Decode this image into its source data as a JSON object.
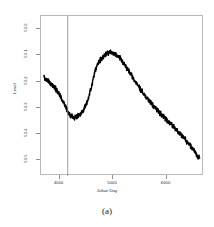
{
  "figure": {
    "caption": "(a)"
  },
  "chart_data": {
    "type": "line",
    "title": "",
    "xlabel": "Julian Day",
    "ylabel": "Level",
    "xlim": [
      3650,
      6700
    ],
    "ylim": [
      52.95,
      53.56
    ],
    "y_inverted": true,
    "grid": false,
    "legend": null,
    "xticks": [
      4000,
      5000,
      6000
    ],
    "xtick_labels": [
      "4000",
      "5000",
      "6000"
    ],
    "yticks": [
      53.0,
      53.1,
      53.2,
      53.3,
      53.4,
      53.5
    ],
    "ytick_labels": [
      "53.0",
      "53.1",
      "53.2",
      "53.3",
      "53.4",
      "53.5"
    ],
    "annotations": [
      {
        "type": "vertical-line",
        "x": 4150,
        "label": "intervention reference line"
      }
    ],
    "series": [
      {
        "name": "Level",
        "noisy": true,
        "noise_amplitude": 0.008,
        "x": [
          3700,
          3780,
          3860,
          3940,
          4020,
          4080,
          4120,
          4160,
          4200,
          4260,
          4320,
          4380,
          4440,
          4500,
          4560,
          4620,
          4660,
          4700,
          4740,
          4800,
          4860,
          4920,
          4980,
          5040,
          5100,
          5160,
          5220,
          5280,
          5340,
          5400,
          5460,
          5520,
          5580,
          5660,
          5740,
          5820,
          5900,
          5980,
          6060,
          6140,
          6220,
          6300,
          6380,
          6460,
          6540,
          6620
        ],
        "y": [
          53.182,
          53.196,
          53.212,
          53.232,
          53.258,
          53.282,
          53.3,
          53.318,
          53.33,
          53.336,
          53.334,
          53.326,
          53.31,
          53.284,
          53.246,
          53.196,
          53.16,
          53.136,
          53.122,
          53.108,
          53.098,
          53.092,
          53.09,
          53.094,
          53.104,
          53.118,
          53.136,
          53.156,
          53.176,
          53.196,
          53.214,
          53.232,
          53.248,
          53.27,
          53.29,
          53.308,
          53.326,
          53.342,
          53.358,
          53.374,
          53.392,
          53.41,
          53.428,
          53.448,
          53.47,
          53.494
        ]
      }
    ]
  }
}
